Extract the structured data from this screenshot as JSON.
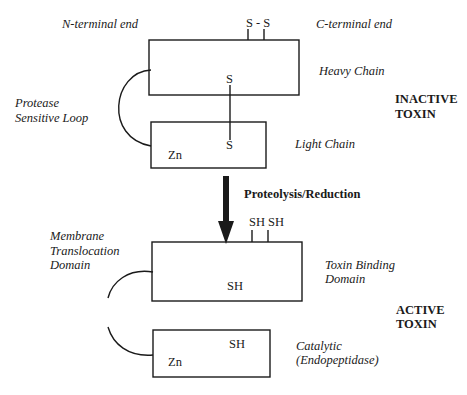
{
  "diagram": {
    "type": "protein-domain-schematic",
    "inactive": {
      "state_label_line1": "INACTIVE",
      "state_label_line2": "TOXIN",
      "n_terminal_label": "N-terminal end",
      "c_terminal_label": "C-terminal end",
      "disulfide_label": "S - S",
      "heavy_chain_label": "Heavy Chain",
      "light_chain_label": "Light Chain",
      "loop_label_line1": "Protease",
      "loop_label_line2": "Sensitive Loop",
      "heavy_s_label": "S",
      "light_s_label": "S",
      "light_zn_label": "Zn"
    },
    "transition": {
      "arrow_label": "Proteolysis/Reduction"
    },
    "active": {
      "state_label_line1": "ACTIVE",
      "state_label_line2": "TOXIN",
      "sulfhydryl_label": "SH SH",
      "translocation_label_line1": "Membrane",
      "translocation_label_line2": "Translocation",
      "translocation_label_line3": "Domain",
      "binding_label_line1": "Toxin Binding",
      "binding_label_line2": "Domain",
      "catalytic_label_line1": "Catalytic",
      "catalytic_label_line2": "(Endopeptidase)",
      "heavy_sh_label": "SH",
      "light_sh_label": "SH",
      "light_zn_label": "Zn"
    },
    "colors": {
      "line": "#1a1a1a",
      "background": "#ffffff"
    }
  }
}
